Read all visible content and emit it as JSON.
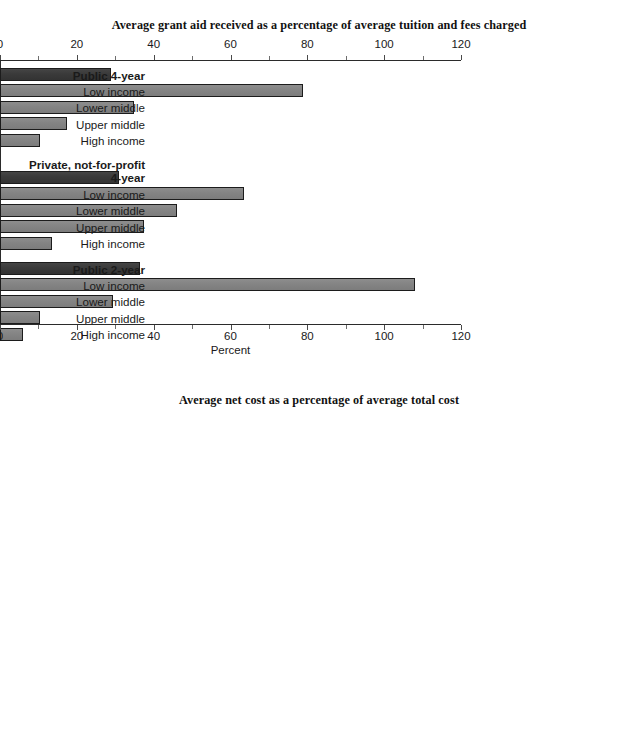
{
  "page": {
    "width": 638,
    "height": 750,
    "background": "#ffffff",
    "bar_color_total": "#3a3a3a",
    "bar_color_sub": "#848484",
    "axis_color": "#2b2b2b"
  },
  "charts": [
    {
      "id": "grant-aid-chart",
      "title": "Average grant aid received as a percentage of average tuition and fees charged",
      "axis_caption": "Percent",
      "tick_labels": [
        "0",
        "20",
        "40",
        "60",
        "80",
        "100",
        "120"
      ],
      "rows": [
        {
          "label": "Public 4-year",
          "kind": "group",
          "value": 29.0
        },
        {
          "label": "Low income",
          "kind": "sub",
          "value": 79.0
        },
        {
          "label": "Lower middle",
          "kind": "sub",
          "value": 35.0
        },
        {
          "label": "Upper middle",
          "kind": "sub",
          "value": 17.5
        },
        {
          "label": "High income",
          "kind": "sub",
          "value": 10.5
        },
        {
          "label": "Private, not-for-profit 4-year",
          "kind": "group",
          "value": 31.0
        },
        {
          "label": "Low income",
          "kind": "sub",
          "value": 63.5
        },
        {
          "label": "Lower middle",
          "kind": "sub",
          "value": 46.0
        },
        {
          "label": "Upper middle",
          "kind": "sub",
          "value": 37.5
        },
        {
          "label": "High income",
          "kind": "sub",
          "value": 13.5
        },
        {
          "label": "Public 2-year",
          "kind": "group",
          "value": 36.5
        },
        {
          "label": "Low income",
          "kind": "sub",
          "value": 108.0
        },
        {
          "label": "Lower middle",
          "kind": "sub",
          "value": 29.5
        },
        {
          "label": "Upper middle",
          "kind": "sub",
          "value": 10.5
        },
        {
          "label": "High income",
          "kind": "sub",
          "value": 6.0
        }
      ]
    },
    {
      "id": "net-cost-chart",
      "title": "Average net cost as a percentage of average total cost",
      "axis_caption": "Percent",
      "tick_labels": [
        "0",
        "20",
        "40",
        "60",
        "80",
        "100",
        "120"
      ],
      "rows": [
        {
          "label": "Public 4-year",
          "kind": "group",
          "value": 79.0
        },
        {
          "label": "Low income",
          "kind": "sub",
          "value": 57.0
        },
        {
          "label": "Lower middle",
          "kind": "sub",
          "value": 72.0
        },
        {
          "label": "Upper middle",
          "kind": "sub",
          "value": 84.5
        },
        {
          "label": "High income",
          "kind": "sub",
          "value": 91.0
        },
        {
          "label": "Private, not-for-profit 4-year",
          "kind": "group",
          "value": 66.5
        },
        {
          "label": "Low income",
          "kind": "sub",
          "value": 41.0
        },
        {
          "label": "Lower middle",
          "kind": "sub",
          "value": 50.5
        },
        {
          "label": "Upper middle",
          "kind": "sub",
          "value": 59.5
        },
        {
          "label": "High income",
          "kind": "sub",
          "value": 83.0
        },
        {
          "label": "Public 2-year",
          "kind": "group",
          "value": 89.0
        },
        {
          "label": "Low income",
          "kind": "sub",
          "value": 78.0
        },
        {
          "label": "Lower middle",
          "kind": "sub",
          "value": 89.0
        },
        {
          "label": "Upper middle",
          "kind": "sub",
          "value": 94.5
        },
        {
          "label": "High income",
          "kind": "sub",
          "value": 94.5
        }
      ]
    }
  ],
  "chart_data": [
    {
      "type": "bar",
      "orientation": "horizontal",
      "title": "Average grant aid received as a percentage of average tuition and fees charged",
      "xlabel": "Percent",
      "ylabel": "",
      "xlim": [
        0,
        120
      ],
      "xticks": [
        0,
        20,
        40,
        60,
        80,
        100,
        120
      ],
      "grid": false,
      "legend": "none",
      "axes_position": "top-and-bottom",
      "categories": [
        "Public 4-year",
        "Low income",
        "Lower middle",
        "Upper middle",
        "High income",
        "Private, not-for-profit 4-year",
        "Low income",
        "Lower middle",
        "Upper middle",
        "High income",
        "Public 2-year",
        "Low income",
        "Lower middle",
        "Upper middle",
        "High income"
      ],
      "values": [
        29.0,
        79.0,
        35.0,
        17.5,
        10.5,
        31.0,
        63.5,
        46.0,
        37.5,
        13.5,
        36.5,
        108.0,
        29.5,
        10.5,
        6.0
      ],
      "groups": [
        {
          "name": "Public 4-year",
          "total": 29.0,
          "income_levels": {
            "Low income": 79.0,
            "Lower middle": 35.0,
            "Upper middle": 17.5,
            "High income": 10.5
          }
        },
        {
          "name": "Private, not-for-profit 4-year",
          "total": 31.0,
          "income_levels": {
            "Low income": 63.5,
            "Lower middle": 46.0,
            "Upper middle": 37.5,
            "High income": 13.5
          }
        },
        {
          "name": "Public 2-year",
          "total": 36.5,
          "income_levels": {
            "Low income": 108.0,
            "Lower middle": 29.5,
            "Upper middle": 10.5,
            "High income": 6.0
          }
        }
      ]
    },
    {
      "type": "bar",
      "orientation": "horizontal",
      "title": "Average net cost as a percentage of average total cost",
      "xlabel": "Percent",
      "ylabel": "",
      "xlim": [
        0,
        120
      ],
      "xticks": [
        0,
        20,
        40,
        60,
        80,
        100,
        120
      ],
      "grid": false,
      "legend": "none",
      "axes_position": "top-and-bottom",
      "categories": [
        "Public 4-year",
        "Low income",
        "Lower middle",
        "Upper middle",
        "High income",
        "Private, not-for-profit 4-year",
        "Low income",
        "Lower middle",
        "Upper middle",
        "High income",
        "Public 2-year",
        "Low income",
        "Lower middle",
        "Upper middle",
        "High income"
      ],
      "values": [
        79.0,
        57.0,
        72.0,
        84.5,
        91.0,
        66.5,
        41.0,
        50.5,
        59.5,
        83.0,
        89.0,
        78.0,
        89.0,
        94.5,
        94.5
      ],
      "groups": [
        {
          "name": "Public 4-year",
          "total": 79.0,
          "income_levels": {
            "Low income": 57.0,
            "Lower middle": 72.0,
            "Upper middle": 84.5,
            "High income": 91.0
          }
        },
        {
          "name": "Private, not-for-profit 4-year",
          "total": 66.5,
          "income_levels": {
            "Low income": 41.0,
            "Lower middle": 50.5,
            "Upper middle": 59.5,
            "High income": 83.0
          }
        },
        {
          "name": "Public 2-year",
          "total": 89.0,
          "income_levels": {
            "Low income": 78.0,
            "Lower middle": 89.0,
            "Upper middle": 94.5,
            "High income": 94.5
          }
        }
      ]
    }
  ]
}
